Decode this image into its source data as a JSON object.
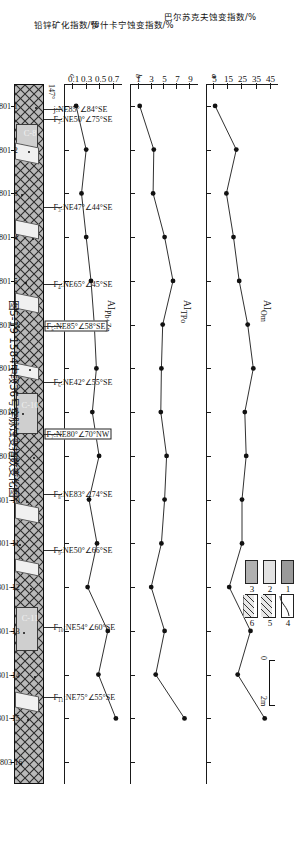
{
  "caption": "图5-19  1584中段36号穿脉蚀变指数变化图",
  "panels": [
    {
      "id": "a",
      "label": "AI",
      "sub": "Om",
      "unit": "%",
      "axis_title": "巴尔苏克夫蚀变指数/%",
      "ticks": [
        5,
        15,
        25,
        35,
        45
      ],
      "min": 1,
      "max": 49
    },
    {
      "id": "b",
      "label": "AI",
      "sub": "TPo",
      "unit": "%",
      "axis_title": "伊什卡宁蚀变指数/%",
      "ticks": [
        1,
        3,
        5,
        7,
        9
      ],
      "min": 0,
      "max": 10
    },
    {
      "id": "c",
      "label": "AI",
      "sub": "Pb+Zn",
      "unit": "%",
      "axis_title": "铅锌矿化指数/%",
      "ticks": [
        0.1,
        0.3,
        0.5,
        0.7
      ],
      "min": 0.0,
      "max": 0.8
    }
  ],
  "chart_data": {
    "type": "line",
    "title": "图5-19  1584中段36号穿脉蚀变指数变化图",
    "xlabel": "",
    "grid": false,
    "legend_position": "none",
    "categories": [
      "H801-1",
      "H801-2",
      "H801-3",
      "H801-4",
      "H801-5",
      "H801-6",
      "H801-7",
      "H801-8",
      "H801-9",
      "H801-10",
      "H801-11",
      "H801-12",
      "H801-13",
      "H801-14",
      "H801-15",
      "W0803-16"
    ],
    "series": [
      {
        "name": "AI_Om",
        "ylabel": "巴尔苏克夫蚀变指数/%",
        "ylim": [
          1,
          49
        ],
        "yticks": [
          5,
          15,
          25,
          35,
          45
        ],
        "values": [
          6,
          21,
          14,
          19,
          23,
          29,
          33,
          27,
          28,
          25,
          25,
          16,
          31,
          22,
          41,
          null
        ]
      },
      {
        "name": "AI_TPo",
        "ylabel": "伊什卡宁蚀变指数/%",
        "ylim": [
          0,
          10
        ],
        "yticks": [
          1,
          3,
          5,
          7,
          9
        ],
        "values": [
          1.2,
          3.4,
          3.3,
          5.1,
          6.4,
          4.8,
          4.6,
          4.5,
          5.4,
          5.1,
          4.6,
          3.0,
          5.1,
          3.7,
          8.2,
          null
        ]
      },
      {
        "name": "AI_Pb+Zn",
        "ylabel": "铅锌矿化指数/%",
        "ylim": [
          0.0,
          0.8
        ],
        "yticks": [
          0.1,
          0.3,
          0.5,
          0.7
        ],
        "values": [
          0.15,
          0.3,
          0.23,
          0.3,
          0.37,
          0.42,
          0.45,
          0.39,
          0.49,
          0.34,
          0.46,
          0.32,
          0.62,
          0.48,
          0.74,
          null
        ]
      }
    ]
  },
  "samples": [
    "H801-1",
    "H801-2",
    "H801-3",
    "H801-4",
    "H801-5",
    "H801-6",
    "H801-7",
    "H801-8",
    "H801-9",
    "H801-10",
    "H801-11",
    "H801-12",
    "H801-13",
    "H801-14",
    "H801-15",
    "W0803-16"
  ],
  "faults": [
    {
      "name": "j",
      "text": "j:NE85°∠84°SE",
      "boxed": false
    },
    {
      "name": "f2",
      "text": "F₂:NE50°∠75°SE",
      "boxed": false
    },
    {
      "name": "f3",
      "text": "F₃:NE47°∠44°SE",
      "boxed": false
    },
    {
      "name": "f4",
      "text": "F₄:NE65°∠45°SE",
      "boxed": false
    },
    {
      "name": "f5",
      "text": "F₅:NE85°∠58°SE",
      "boxed": true
    },
    {
      "name": "f6",
      "text": "F₆:NE42°∠55°SE",
      "boxed": false
    },
    {
      "name": "f7",
      "text": "F₇:NE80°∠70°NW",
      "boxed": true
    },
    {
      "name": "f8",
      "text": "F₈:NE83°∠74°SE",
      "boxed": false
    },
    {
      "name": "f9",
      "text": "F₉:NE50°∠66°SE",
      "boxed": false
    },
    {
      "name": "f10",
      "text": "F₁₀:NE54°∠60°SE",
      "boxed": false
    },
    {
      "name": "f11",
      "text": "F₁₁:NE75°∠55°SE",
      "boxed": false
    }
  ],
  "bearing_left": "147°",
  "ore_bodies": [
    {
      "label": "C-8"
    },
    {
      "label": "C-10"
    },
    {
      "label": "C-11"
    }
  ],
  "legend": {
    "items": [
      {
        "num": "1",
        "pattern": "dark-gray-fill"
      },
      {
        "num": "2",
        "pattern": "light-gray-fill"
      },
      {
        "num": "3",
        "pattern": "mid-gray-fill"
      },
      {
        "num": "4",
        "pattern": "curve-line"
      },
      {
        "num": "5",
        "pattern": "diagonal-hatch"
      },
      {
        "num": "6",
        "pattern": "diagonal-hatch-2"
      }
    ]
  },
  "scale": {
    "zero": "0",
    "max": "2m"
  },
  "colors": {
    "ink": "#111111",
    "strip_fill": "#b9b9b9",
    "ore_fill": "#cfcfcf",
    "legend_dark": "#9a9a9a",
    "legend_light": "#e2e2e2",
    "legend_mid": "#b0b0b0"
  }
}
